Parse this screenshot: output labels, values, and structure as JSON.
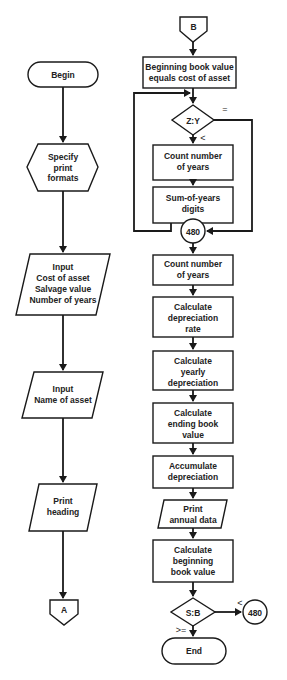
{
  "flowchart": {
    "left": {
      "begin": {
        "lines": [
          "Begin"
        ]
      },
      "specify": {
        "lines": [
          "Specify",
          "print",
          "formats"
        ]
      },
      "input1": {
        "lines": [
          "Input",
          "Cost of asset",
          "Salvage value",
          "Number of years"
        ]
      },
      "input2": {
        "lines": [
          "Input",
          "Name of asset"
        ]
      },
      "print_heading": {
        "lines": [
          "Print",
          "heading"
        ]
      },
      "connector_a": {
        "lines": [
          "A"
        ]
      }
    },
    "right": {
      "connector_b": {
        "lines": [
          "B"
        ]
      },
      "beginning": {
        "lines": [
          "Beginning book value",
          "equals cost of asset"
        ]
      },
      "decision_zy": {
        "lines": [
          "Z:Y"
        ],
        "eq_label": "=",
        "lt_label": "<"
      },
      "count1": {
        "lines": [
          "Count number",
          "of years"
        ]
      },
      "sum_digits": {
        "lines": [
          "Sum-of-years",
          "digits"
        ]
      },
      "node_480": {
        "lines": [
          "480"
        ]
      },
      "count2": {
        "lines": [
          "Count number",
          "of years"
        ]
      },
      "calc_rate": {
        "lines": [
          "Calculate",
          "depreciation",
          "rate"
        ]
      },
      "calc_yearly": {
        "lines": [
          "Calculate",
          "yearly",
          "depreciation"
        ]
      },
      "calc_ending": {
        "lines": [
          "Calculate",
          "ending book",
          "value"
        ]
      },
      "accumulate": {
        "lines": [
          "Accumulate",
          "depreciation"
        ]
      },
      "print_annual": {
        "lines": [
          "Print",
          "annual data"
        ]
      },
      "calc_beginning": {
        "lines": [
          "Calculate",
          "beginning",
          "book value"
        ]
      },
      "decision_sb": {
        "lines": [
          "S:B"
        ],
        "lt_label": "<",
        "ge_label": ">="
      },
      "node_480b": {
        "lines": [
          "480"
        ]
      },
      "end": {
        "lines": [
          "End"
        ]
      }
    }
  }
}
